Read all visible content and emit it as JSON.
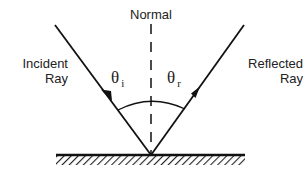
{
  "labels": {
    "normal": "Normal",
    "incident_line1": "Incident",
    "incident_line2": "Ray",
    "reflected_line1": "Reflected",
    "reflected_line2": "Ray",
    "theta_i_symbol": "θ",
    "theta_i_sub": "i",
    "theta_r_symbol": "θ",
    "theta_r_sub": "r"
  },
  "colors": {
    "stroke": "#111111",
    "background": "#ffffff"
  },
  "geometry": {
    "point_of_incidence": [
      151,
      155
    ],
    "incident_start": [
      55,
      25
    ],
    "reflected_end": [
      244,
      25
    ],
    "surface": {
      "x1": 56,
      "x2": 245,
      "y": 155
    },
    "normal": {
      "x": 151,
      "y1": 24,
      "y2": 155
    }
  }
}
